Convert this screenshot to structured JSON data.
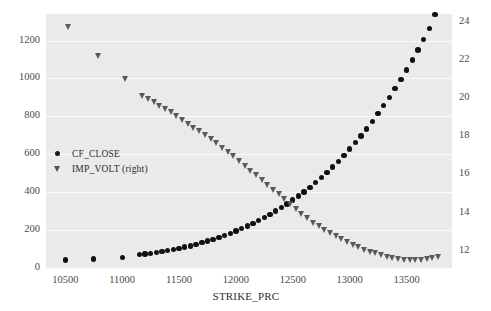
{
  "chart_data": {
    "type": "scatter",
    "title": "",
    "xlabel": "STRIKE_PRC",
    "ylabel": "",
    "y2label": "",
    "grid": true,
    "legend_position": "center-left",
    "xlim": [
      10330,
      13900
    ],
    "ylim": [
      0,
      1340
    ],
    "y2lim": [
      11.1,
      24.4
    ],
    "xticks": [
      10500,
      11000,
      11500,
      12000,
      12500,
      13000,
      13500
    ],
    "yticks": [
      0,
      200,
      400,
      600,
      800,
      1000,
      1200
    ],
    "y2ticks": [
      12,
      14,
      16,
      18,
      20,
      22,
      24
    ],
    "series": [
      {
        "name": "CF_CLOSE",
        "axis": "left",
        "marker": "circle",
        "color": "#111111",
        "x": [
          10500,
          10750,
          11000,
          11150,
          11200,
          11250,
          11300,
          11350,
          11400,
          11450,
          11500,
          11550,
          11600,
          11650,
          11700,
          11750,
          11800,
          11850,
          11900,
          11950,
          12000,
          12050,
          12100,
          12150,
          12200,
          12250,
          12300,
          12350,
          12400,
          12450,
          12500,
          12550,
          12600,
          12650,
          12700,
          12750,
          12800,
          12850,
          12900,
          12950,
          13000,
          13050,
          13100,
          13150,
          13200,
          13250,
          13300,
          13350,
          13400,
          13450,
          13500,
          13550,
          13600,
          13650,
          13700,
          13750
        ],
        "y": [
          42,
          48,
          55,
          70,
          74,
          78,
          82,
          86,
          92,
          97,
          103,
          110,
          117,
          125,
          133,
          142,
          151,
          161,
          172,
          183,
          195,
          208,
          221,
          235,
          250,
          266,
          283,
          300,
          319,
          338,
          358,
          380,
          402,
          426,
          451,
          477,
          504,
          533,
          563,
          594,
          627,
          661,
          697,
          734,
          773,
          814,
          857,
          901,
          947,
          995,
          1045,
          1097,
          1151,
          1207,
          1265,
          1338
        ]
      },
      {
        "name": "IMP_VOLT (right)",
        "axis": "right",
        "marker": "triangle-down",
        "color": "#5a5a5a",
        "x": [
          10530,
          10790,
          11030,
          11180,
          11230,
          11280,
          11330,
          11380,
          11430,
          11480,
          11530,
          11580,
          11630,
          11680,
          11730,
          11780,
          11830,
          11880,
          11930,
          11980,
          12030,
          12080,
          12130,
          12180,
          12230,
          12280,
          12330,
          12380,
          12430,
          12480,
          12530,
          12580,
          12630,
          12680,
          12730,
          12780,
          12830,
          12880,
          12930,
          12980,
          13030,
          13080,
          13130,
          13180,
          13230,
          13280,
          13330,
          13380,
          13430,
          13480,
          13530,
          13580,
          13630,
          13680,
          13730,
          13780
        ],
        "y": [
          23.7,
          22.2,
          21.0,
          20.1,
          19.95,
          19.8,
          19.6,
          19.42,
          19.25,
          19.05,
          18.85,
          18.65,
          18.45,
          18.25,
          18.05,
          17.85,
          17.62,
          17.4,
          17.18,
          16.95,
          16.7,
          16.45,
          16.2,
          15.95,
          15.7,
          15.45,
          15.2,
          14.95,
          14.7,
          14.45,
          14.18,
          13.95,
          13.7,
          13.48,
          13.28,
          13.1,
          12.92,
          12.75,
          12.6,
          12.45,
          12.3,
          12.18,
          12.06,
          11.96,
          11.87,
          11.78,
          11.7,
          11.63,
          11.57,
          11.52,
          11.5,
          11.5,
          11.52,
          11.55,
          11.6,
          11.66
        ]
      }
    ]
  },
  "legend": {
    "items": [
      {
        "label": "CF_CLOSE",
        "marker": "circle"
      },
      {
        "label": "IMP_VOLT (right)",
        "marker": "triangle-down"
      }
    ]
  },
  "colors": {
    "plot_background": "#eaeaea",
    "gridline": "#fbfbfb",
    "figure_background": "#ffffff",
    "series_primary": "#111111",
    "series_secondary": "#5a5a5a",
    "tick_text": "#4a4a4a",
    "axis_label_text": "#2e2e2e"
  }
}
